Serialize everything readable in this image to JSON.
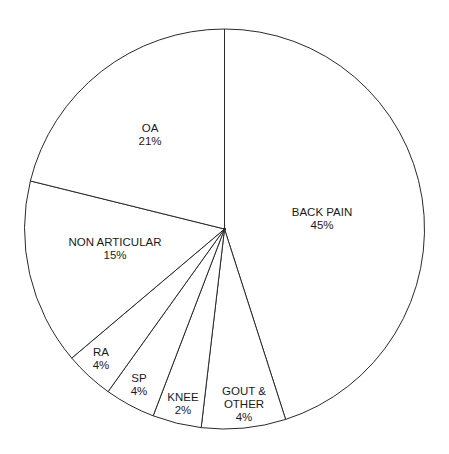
{
  "chart_data": {
    "type": "pie",
    "title": "",
    "start_angle_deg": -90,
    "direction": "clockwise",
    "center": [
      224.5,
      229
    ],
    "radius": 200,
    "stroke_color": "#2a2a2a",
    "fill_color": "#ffffff",
    "categories": [
      "BACK PAIN",
      "GOUT & OTHER",
      "KNEE",
      "SP",
      "RA",
      "NON ARTICULAR",
      "OA"
    ],
    "values": [
      45,
      4,
      2,
      4,
      4,
      15,
      21
    ],
    "value_unit": "%",
    "slices": [
      {
        "name": "BACK PAIN",
        "value": 45,
        "label_lines": [
          "BACK PAIN",
          "45%"
        ],
        "start_deg": -90,
        "end_deg": 72.2,
        "label_pos": [
          322,
          216
        ]
      },
      {
        "name": "GOUT & OTHER",
        "value": 4,
        "label_lines": [
          "GOUT &",
          "OTHER",
          "4%"
        ],
        "start_deg": 72.2,
        "end_deg": 96.7,
        "label_pos": [
          244,
          395
        ]
      },
      {
        "name": "KNEE",
        "value": 2,
        "label_lines": [
          "KNEE",
          "2%"
        ],
        "start_deg": 96.7,
        "end_deg": 110.9,
        "label_pos": [
          183,
          401
        ]
      },
      {
        "name": "SP",
        "value": 4,
        "label_lines": [
          "SP",
          "4%"
        ],
        "start_deg": 110.9,
        "end_deg": 125.6,
        "label_pos": [
          139,
          382
        ]
      },
      {
        "name": "RA",
        "value": 4,
        "label_lines": [
          "RA",
          "4%"
        ],
        "start_deg": 125.6,
        "end_deg": 139.8,
        "label_pos": [
          101,
          356
        ]
      },
      {
        "name": "NON ARTICULAR",
        "value": 15,
        "label_lines": [
          "NON ARTICULAR",
          "15%"
        ],
        "start_deg": 139.8,
        "end_deg": 193.9,
        "label_pos": [
          115,
          246
        ]
      },
      {
        "name": "OA",
        "value": 21,
        "label_lines": [
          "OA",
          "21%"
        ],
        "start_deg": 193.9,
        "end_deg": 270,
        "label_pos": [
          150,
          132
        ]
      }
    ],
    "legend": null,
    "xlabel": "",
    "ylabel": ""
  }
}
